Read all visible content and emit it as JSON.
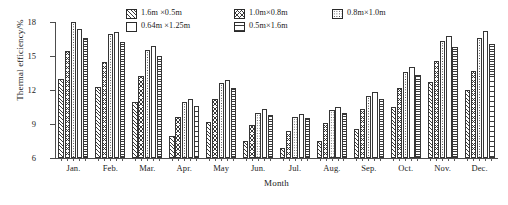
{
  "chart_data": {
    "type": "bar",
    "title": "",
    "xlabel": "Month",
    "ylabel": "Thermal efficiency/%",
    "categories": [
      "Jan.",
      "Feb.",
      "Mar.",
      "Apr.",
      "May",
      "Jun.",
      "Jul.",
      "Aug.",
      "Sep.",
      "Oct.",
      "Nov.",
      "Dec."
    ],
    "ylim": [
      6,
      18
    ],
    "yticks": [
      6,
      9,
      12,
      15,
      18
    ],
    "grid": false,
    "legend_position": "top",
    "series": [
      {
        "name": "1.6m ×0.5m",
        "pattern": "diagonal-hatch",
        "values": [
          13.0,
          12.3,
          10.9,
          7.9,
          9.2,
          7.5,
          6.9,
          7.5,
          8.6,
          10.5,
          12.7,
          12.0
        ]
      },
      {
        "name": "1.0m×0.8m",
        "pattern": "chevron-hatch",
        "values": [
          15.4,
          14.5,
          13.2,
          9.6,
          11.2,
          8.9,
          8.4,
          9.1,
          10.3,
          12.2,
          14.6,
          13.7
        ]
      },
      {
        "name": "0.8m×1.0m",
        "pattern": "dotted",
        "values": [
          18.0,
          16.9,
          15.5,
          10.9,
          12.6,
          10.0,
          9.6,
          10.2,
          11.5,
          13.6,
          16.3,
          16.6
        ]
      },
      {
        "name": "0.64m ×1.25m",
        "pattern": "blank",
        "values": [
          17.4,
          17.1,
          15.9,
          11.2,
          12.9,
          10.3,
          9.9,
          10.5,
          11.8,
          14.0,
          16.8,
          17.2
        ]
      },
      {
        "name": "0.5m×1.6m",
        "pattern": "horizontal-hatch",
        "values": [
          16.6,
          16.2,
          15.0,
          10.6,
          12.2,
          9.8,
          9.5,
          10.0,
          11.2,
          13.3,
          15.8,
          16.1
        ]
      }
    ]
  },
  "axes": {
    "y_title": "Thermal efficiency/%",
    "x_title": "Month",
    "y_tick_labels": [
      "18",
      "15",
      "12",
      "9",
      "6"
    ],
    "x_tick_labels": [
      "Jan.",
      "Feb.",
      "Mar.",
      "Apr.",
      "May",
      "Jun.",
      "Jul.",
      "Aug.",
      "Sep.",
      "Oct.",
      "Nov.",
      "Dec."
    ]
  },
  "legend": {
    "items": [
      {
        "label": "1.6m ×0.5m",
        "pattern": "diagonal-hatch"
      },
      {
        "label": "1.0m×0.8m",
        "pattern": "chevron-hatch"
      },
      {
        "label": "0.8m×1.0m",
        "pattern": "dotted"
      },
      {
        "label": "0.64m ×1.25m",
        "pattern": "blank"
      },
      {
        "label": "0.5m×1.6m",
        "pattern": "horizontal-hatch"
      }
    ]
  },
  "colors": {
    "axis": "#4d4d4d",
    "bar_outline": "#353535",
    "background": "#ffffff",
    "text": "#1a1a1a"
  }
}
